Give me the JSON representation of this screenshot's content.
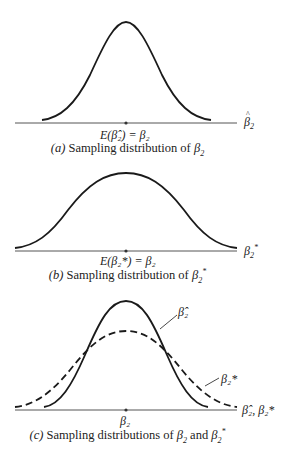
{
  "panels": [
    {
      "id": "a",
      "axis_label_sym": "β",
      "axis_label_sub": "2",
      "axis_label_hat": true,
      "center_label": "E(β̂₂) = β₂",
      "caption_prefix": "(a)",
      "caption_text": "Sampling distribution of ",
      "caption_sym": "β",
      "caption_sub": "2"
    },
    {
      "id": "b",
      "axis_label_sym": "β",
      "axis_label_sub": "2",
      "axis_label_sup": "*",
      "center_label": "E(β₂*) = β₂",
      "caption_prefix": "(b)",
      "caption_text": "Sampling distribution of ",
      "caption_sym": "β",
      "caption_sub": "2",
      "caption_sup": "*"
    },
    {
      "id": "c",
      "axis_label": "β̂₂, β₂*",
      "center_label": "β₂",
      "curve_label_solid": "β̂₂",
      "curve_label_dashed": "β₂*",
      "caption_prefix": "(c)",
      "caption_text": "Sampling distributions of ",
      "caption_sym1": "β",
      "caption_sub1": "2",
      "caption_and": " and ",
      "caption_sym2": "β",
      "caption_sub2": "2",
      "caption_sup2": "*"
    }
  ],
  "colors": {
    "curve": "#1a1a1a",
    "axis": "#555555"
  }
}
